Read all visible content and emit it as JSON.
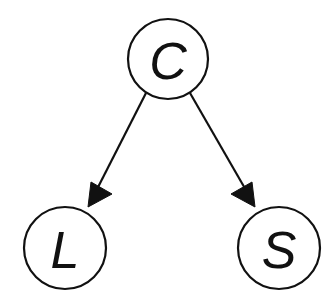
{
  "diagram": {
    "type": "directed-graph",
    "title": "",
    "background_color": "#ffffff",
    "stroke_color": "#111111",
    "canvas": {
      "width": 333,
      "height": 307
    },
    "nodes": [
      {
        "id": "C",
        "label": "C",
        "role": "parent",
        "cx": 168,
        "cy": 59,
        "r": 40,
        "fill": "#ffffff",
        "stroke": "#111111"
      },
      {
        "id": "L",
        "label": "L",
        "role": "child",
        "cx": 65,
        "cy": 248,
        "r": 41,
        "fill": "#ffffff",
        "stroke": "#111111"
      },
      {
        "id": "S",
        "label": "S",
        "role": "child",
        "cx": 279,
        "cy": 248,
        "r": 41,
        "fill": "#ffffff",
        "stroke": "#111111"
      }
    ],
    "edges": [
      {
        "id": "C-to-L",
        "from": "C",
        "to": "L",
        "label": "",
        "directed": true,
        "x1": 146,
        "y1": 93,
        "x2": 92,
        "y2": 199,
        "head_x": 88,
        "head_y": 206,
        "head_angle_deg": 117
      },
      {
        "id": "C-to-S",
        "from": "C",
        "to": "S",
        "label": "",
        "directed": true,
        "x1": 190,
        "y1": 93,
        "x2": 251,
        "y2": 199,
        "head_x": 255,
        "head_y": 206,
        "head_angle_deg": 61
      }
    ]
  }
}
